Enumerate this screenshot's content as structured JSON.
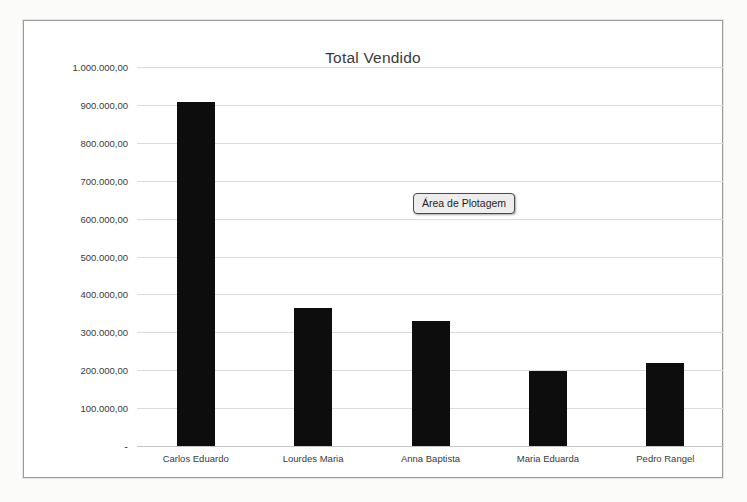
{
  "chart_data": {
    "type": "bar",
    "title": "Total Vendido",
    "xlabel": "",
    "ylabel": "",
    "categories": [
      "Carlos Eduardo",
      "Lourdes Maria",
      "Anna Baptista",
      "Maria Eduarda",
      "Pedro Rangel"
    ],
    "values": [
      908000,
      365000,
      330000,
      198000,
      218000
    ],
    "ylim": [
      0,
      1000000
    ],
    "ytick_values": [
      1000000,
      900000,
      800000,
      700000,
      600000,
      500000,
      400000,
      300000,
      200000,
      100000,
      0
    ],
    "ytick_labels": [
      "1.000.000,00",
      "900.000,00",
      "800.000,00",
      "700.000,00",
      "600.000,00",
      "500.000,00",
      "400.000,00",
      "300.000,00",
      "200.000,00",
      "100.000,00",
      "-"
    ],
    "grid": true,
    "legend": false,
    "bar_color": "#0d0d0d",
    "gridline_color": "#dcdcdc"
  },
  "tooltip": {
    "label": "Área de Plotagem"
  }
}
